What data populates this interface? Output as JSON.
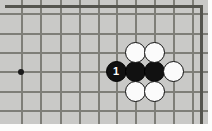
{
  "diagram": {
    "type": "go-board",
    "board_color": "#c9c9c7",
    "grid_color": "#7e7e78",
    "edge_color": "#55554f",
    "black_color": "#111111",
    "white_color": "#fbfbfb",
    "grid": {
      "spacing_x": 19.4,
      "spacing_y": 19.4,
      "origin_x": 21,
      "origin_y": 13,
      "columns": 10,
      "rows": 6,
      "vertical_lines": [
        21,
        40,
        60,
        79,
        98,
        116,
        135,
        154,
        173,
        192
      ],
      "horizontal_lines": [
        13,
        33,
        52,
        71,
        91,
        110
      ]
    },
    "star_points": [
      {
        "name": "hoshi",
        "x": 21,
        "y": 72
      }
    ],
    "stones": [
      {
        "color": "black",
        "x": 116,
        "y": 71,
        "label": "1"
      },
      {
        "color": "black",
        "x": 135,
        "y": 71,
        "label": ""
      },
      {
        "color": "black",
        "x": 154,
        "y": 71,
        "label": ""
      },
      {
        "color": "white",
        "x": 135,
        "y": 52,
        "label": ""
      },
      {
        "color": "white",
        "x": 154,
        "y": 52,
        "label": ""
      },
      {
        "color": "white",
        "x": 135,
        "y": 91,
        "label": ""
      },
      {
        "color": "white",
        "x": 154,
        "y": 91,
        "label": ""
      },
      {
        "color": "white",
        "x": 173,
        "y": 71,
        "label": ""
      }
    ]
  }
}
